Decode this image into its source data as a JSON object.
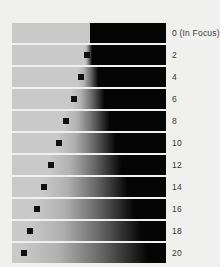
{
  "chart_data": {
    "type": "bar",
    "title": "",
    "subtitle": "",
    "xlabel": "",
    "ylabel": "",
    "legend_position": "right",
    "grid": false,
    "categories": [
      "0 (In Focus)",
      "2",
      "4",
      "6",
      "8",
      "10",
      "12",
      "14",
      "16",
      "18",
      "20"
    ],
    "values": [
      0,
      2,
      4,
      6,
      8,
      10,
      12,
      14,
      16,
      18,
      20
    ],
    "series": [
      {
        "name": "Edge transition start (% of bar width)",
        "values": [
          50.5,
          47.0,
          43.0,
          38.5,
          33.5,
          29.0,
          24.0,
          19.5,
          15.0,
          10.5,
          6.0
        ]
      },
      {
        "name": "Edge transition end (% of bar width)",
        "values": [
          50.5,
          52.0,
          56.0,
          60.0,
          63.5,
          67.5,
          71.0,
          75.0,
          79.0,
          84.0,
          88.0
        ]
      },
      {
        "name": "Marker position (% of bar width)",
        "values": [
          null,
          49.0,
          44.5,
          40.0,
          35.0,
          30.5,
          25.5,
          21.0,
          16.5,
          12.0,
          7.5
        ]
      }
    ],
    "colors": {
      "background": "#f0f0ee",
      "bar_light": "#c9c9c9",
      "bar_dark": "#050505",
      "marker": "#111111",
      "label_text": "#3a3a3a"
    },
    "ylim": [
      0,
      20
    ],
    "xlim": [
      0,
      100
    ]
  },
  "figure": {
    "rows": [
      {
        "label": "0 (In Focus)",
        "start": 50.5,
        "end": 50.5,
        "marker": null,
        "top": 23
      },
      {
        "label": "2",
        "start": 47.0,
        "end": 52.0,
        "marker": 49.0,
        "top": 45
      },
      {
        "label": "4",
        "start": 43.0,
        "end": 56.0,
        "marker": 44.5,
        "top": 67
      },
      {
        "label": "6",
        "start": 38.5,
        "end": 60.0,
        "marker": 40.0,
        "top": 89
      },
      {
        "label": "8",
        "start": 33.5,
        "end": 63.5,
        "marker": 35.0,
        "top": 111
      },
      {
        "label": "10",
        "start": 29.0,
        "end": 67.5,
        "marker": 30.5,
        "top": 133
      },
      {
        "label": "12",
        "start": 24.0,
        "end": 71.0,
        "marker": 25.5,
        "top": 155
      },
      {
        "label": "14",
        "start": 19.5,
        "end": 75.0,
        "marker": 21.0,
        "top": 177
      },
      {
        "label": "16",
        "start": 15.0,
        "end": 79.0,
        "marker": 16.5,
        "top": 199
      },
      {
        "label": "18",
        "start": 10.5,
        "end": 84.0,
        "marker": 12.0,
        "top": 221
      },
      {
        "label": "20",
        "start": 6.0,
        "end": 88.0,
        "marker": 7.5,
        "top": 243
      }
    ]
  }
}
